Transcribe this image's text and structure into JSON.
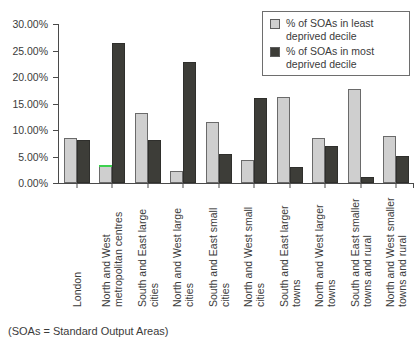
{
  "chart_data": {
    "type": "bar",
    "title": "",
    "xlabel": "",
    "ylabel": "",
    "ylim": [
      0,
      30
    ],
    "ytick_labels": [
      "0.00%",
      "5.00%",
      "10.00%",
      "15.00%",
      "20.00%",
      "25.00%",
      "30.00%"
    ],
    "ytick_values": [
      0,
      5,
      10,
      15,
      20,
      25,
      30
    ],
    "grid": false,
    "legend_position": "top-right",
    "categories": [
      "London",
      "North and West metropolitan centres",
      "South and East large cities",
      "North and West large cities",
      "South and East small cities",
      "North and West small cities",
      "South and East larger towns",
      "North and West larger towns",
      "South and East smaller towns and rural",
      "North and West smaller towns and rural"
    ],
    "series": [
      {
        "name": "% of SOAs in least deprived decile",
        "color": "#cfcfcf",
        "values": [
          8.5,
          3.4,
          13.3,
          2.3,
          11.5,
          4.4,
          16.3,
          8.4,
          17.7,
          8.8
        ]
      },
      {
        "name": "% of SOAs in most deprived decile",
        "color": "#3d3d38",
        "values": [
          8.2,
          26.5,
          8.2,
          22.8,
          5.4,
          16.0,
          3.1,
          6.9,
          1.2,
          5.1
        ]
      }
    ],
    "annotations": {
      "highlight_color": "#3dd14f",
      "highlight_note": "green cap line over least-deprived bar of North and West metropolitan centres"
    }
  },
  "legend": {
    "items": [
      {
        "label": "% of SOAs in least\ndeprived decile",
        "swatch": "least"
      },
      {
        "label": "% of SOAs in most\ndeprived decile",
        "swatch": "most"
      }
    ]
  },
  "footnote": {
    "text": "(SOAs = Standard Output Areas)"
  }
}
